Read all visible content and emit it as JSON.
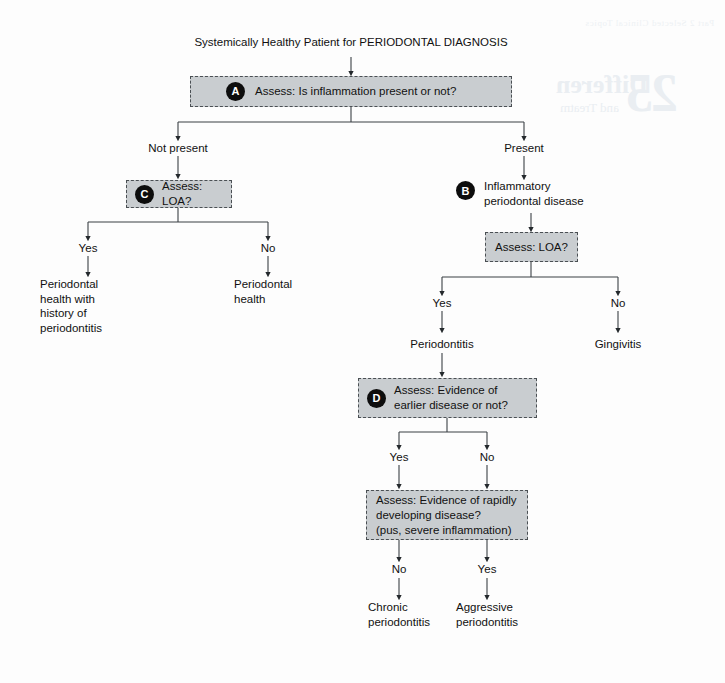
{
  "page": {
    "background_color": "#fdfdfd",
    "box_fill_color": "#c9cdd0",
    "box_border_color": "#4a4f53",
    "badge_color": "#0d0d0d",
    "line_color": "#3b4145"
  },
  "ghost_text": {
    "header": "Part 2 Selected Clinical Topics",
    "number": "25",
    "word": "Differen",
    "sub": "and Treatm"
  },
  "diagram": {
    "title": "Systemically Healthy Patient for PERIODONTAL DIAGNOSIS",
    "decision_a": {
      "badge": "A",
      "label": "Assess: Is inflammation present or not?"
    },
    "branch_a_left": "Not present",
    "branch_a_right": "Present",
    "decision_c": {
      "badge": "C",
      "label": "Assess: LOA?"
    },
    "branch_c_left": "Yes",
    "branch_c_right": "No",
    "outcome_c_left": "Periodontal\nhealth with\nhistory of\nperiodontitis",
    "outcome_c_right": "Periodontal\nhealth",
    "node_b": {
      "badge": "B",
      "label": "Inflammatory\nperiodontal disease"
    },
    "decision_loa_right": {
      "label": "Assess: LOA?"
    },
    "branch_loa_left": "Yes",
    "branch_loa_right": "No",
    "outcome_periodontitis": "Periodontitis",
    "outcome_gingivitis": "Gingivitis",
    "decision_d": {
      "badge": "D",
      "label": "Assess: Evidence of\nearlier disease or not?"
    },
    "branch_d_left": "Yes",
    "branch_d_right": "No",
    "decision_rapid": {
      "label": "Assess: Evidence of rapidly\ndeveloping disease?\n(pus, severe inflammation)"
    },
    "branch_rapid_left": "No",
    "branch_rapid_right": "Yes",
    "outcome_chronic": "Chronic\nperiodontitis",
    "outcome_aggressive": "Aggressive\nperiodontitis"
  }
}
